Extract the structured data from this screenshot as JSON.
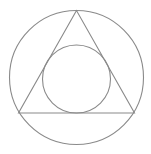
{
  "diagram": {
    "title": "",
    "stroke_color": "#8a8a8a",
    "background": "#ffffff",
    "shapes": {
      "outer_circle": {
        "cx": 76.5,
        "cy": 77.5,
        "r": 67
      },
      "triangle": {
        "points": "76.5,10.5 18.5,113 134.5,113"
      },
      "inner_circle": {
        "cx": 76.5,
        "cy": 79,
        "r": 34
      }
    }
  }
}
